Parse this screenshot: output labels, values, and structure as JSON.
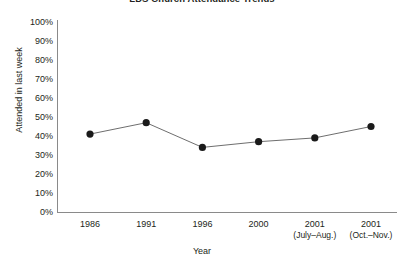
{
  "chart_data": {
    "type": "line",
    "title": "LDS Church Attendance Trends",
    "xlabel": "Year",
    "ylabel": "Attended in last week",
    "categories": [
      "1986",
      "1991",
      "1996",
      "2000",
      "2001",
      "2001"
    ],
    "category_sublabels": [
      "",
      "",
      "",
      "",
      "(July–Aug.)",
      "(Oct.–Nov.)"
    ],
    "values": [
      41,
      47,
      34,
      37,
      39,
      45
    ],
    "ylim": [
      0,
      100
    ],
    "ytick_labels": [
      "100%",
      "90%",
      "80%",
      "70%",
      "60%",
      "50%",
      "40%",
      "30%",
      "20%",
      "10%",
      "0%"
    ],
    "ytick_values": [
      100,
      90,
      80,
      70,
      60,
      50,
      40,
      30,
      20,
      10,
      0
    ],
    "grid": false,
    "legend": "none",
    "marker_color": "#1a1a1a",
    "line_color": "#6e6e6e",
    "axis_color": "#8a8a8a"
  }
}
